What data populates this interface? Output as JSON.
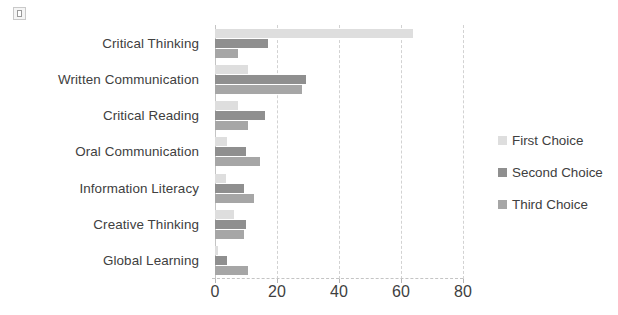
{
  "icons": {
    "placeholder": "broken-image-icon"
  },
  "chart_data": {
    "type": "bar",
    "orientation": "horizontal",
    "title": "",
    "xlabel": "",
    "ylabel": "",
    "xlim": [
      0,
      80
    ],
    "xticks": [
      0,
      20,
      40,
      60,
      80
    ],
    "grid": true,
    "legend_position": "right",
    "categories": [
      "Critical Thinking",
      "Written Communication",
      "Critical Reading",
      "Oral Communication",
      "Information Literacy",
      "Creative Thinking",
      "Global Learning"
    ],
    "series": [
      {
        "name": "First Choice",
        "color": "#dedede",
        "values": [
          64,
          10.5,
          7.5,
          4,
          3.5,
          6,
          1
        ]
      },
      {
        "name": "Second Choice",
        "color": "#8f8f8f",
        "values": [
          17,
          29.5,
          16,
          10,
          9.5,
          10,
          4
        ]
      },
      {
        "name": "Third Choice",
        "color": "#a6a6a6",
        "values": [
          7.5,
          28,
          10.5,
          14.5,
          12.5,
          9.5,
          10.5
        ]
      }
    ]
  }
}
